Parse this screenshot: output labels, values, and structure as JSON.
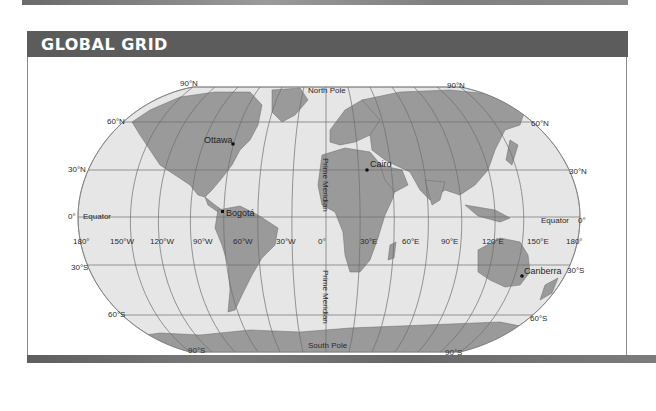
{
  "header": {
    "title": "GLOBAL GRID"
  },
  "colors": {
    "title_bar": "#5c5c5c",
    "ocean": "#e6e6e6",
    "land": "#9a9a9a",
    "grid_line": "#6e6e6e",
    "label": "#2b2b2b"
  },
  "map": {
    "projection_labels": {
      "north_pole": "North Pole",
      "south_pole": "South Pole",
      "prime_meridian_upper": "Prime Meridian",
      "prime_meridian_lower": "Prime Meridian",
      "equator_left": "Equator",
      "equator_right": "Equator"
    },
    "latitude_labels_left": [
      "90°N",
      "60°N",
      "30°N",
      "0°",
      "30°S",
      "60°S",
      "90°S"
    ],
    "latitude_labels_right": [
      "90°N",
      "60°N",
      "30°N",
      "0°",
      "30°S",
      "60°S",
      "90°S"
    ],
    "longitude_labels": [
      "180°",
      "150°W",
      "120°W",
      "90°W",
      "60°W",
      "30°W",
      "0°",
      "30°E",
      "60°E",
      "90°E",
      "120°E",
      "150°E",
      "180°"
    ],
    "cities": [
      {
        "name": "Ottawa"
      },
      {
        "name": "Cairo"
      },
      {
        "name": "Bogotá"
      },
      {
        "name": "Canberra"
      }
    ]
  }
}
